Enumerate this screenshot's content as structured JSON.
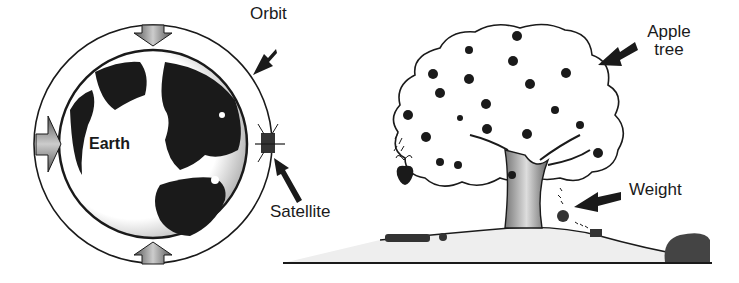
{
  "labels": {
    "orbit": "Orbit",
    "earth": "Earth",
    "satellite": "Satellite",
    "apple_tree_line1": "Apple",
    "apple_tree_line2": "tree",
    "weight": "Weight"
  },
  "colors": {
    "ink": "#1a1a1a",
    "background": "#ffffff",
    "shade": "#888888"
  }
}
